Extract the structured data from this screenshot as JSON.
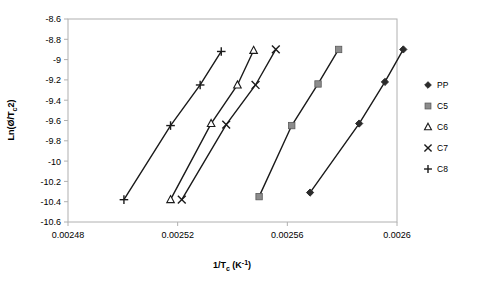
{
  "chart_data": {
    "type": "scatter",
    "title": "",
    "xlabel": "1/Tₑ (K⁻¹)",
    "xlabel_parts": {
      "pre": "1/T",
      "sub": "c",
      "post": " (K",
      "sup": "-1",
      "tail": ")"
    },
    "ylabel": "Ln(Ø/Tₑ 2)",
    "ylabel_parts": {
      "pre": "Ln(Ø/T",
      "sub": "c",
      "post": "2)"
    },
    "xlim": [
      0.00248,
      0.0026
    ],
    "ylim": [
      -10.6,
      -8.6
    ],
    "xticks": [
      "0.00248",
      "0.00252",
      "0.00256",
      "0.0026"
    ],
    "xtick_values": [
      0.00248,
      0.00252,
      0.00256,
      0.0026
    ],
    "yticks": [
      "-8.6",
      "-8.8",
      "-9",
      "-9.2",
      "-9.4",
      "-9.6",
      "-9.8",
      "-10",
      "-10.2",
      "-10.4",
      "-10.6"
    ],
    "ytick_values": [
      -8.6,
      -8.8,
      -9,
      -9.2,
      -9.4,
      -9.6,
      -9.8,
      -10,
      -10.2,
      -10.4,
      -10.6
    ],
    "grid": false,
    "legend_position": "right",
    "series": [
      {
        "name": "PP",
        "marker": "diamond",
        "color": "#2b2b2b",
        "x": [
          0.0025683,
          0.0025862,
          0.0025956,
          0.0026023
        ],
        "y": [
          -10.31,
          -9.63,
          -9.22,
          -8.9
        ]
      },
      {
        "name": "C5",
        "marker": "square",
        "color": "#8c8c8c",
        "x": [
          0.0025497,
          0.0025616,
          0.0025712,
          0.0025787
        ],
        "y": [
          -10.35,
          -9.65,
          -9.24,
          -8.9
        ]
      },
      {
        "name": "C6",
        "marker": "triangle",
        "color": "#1a1a1a",
        "x": [
          0.0025174,
          0.0025322,
          0.0025418,
          0.0025477
        ],
        "y": [
          -10.38,
          -9.63,
          -9.25,
          -8.91
        ]
      },
      {
        "name": "C7",
        "marker": "cross-x",
        "color": "#1a1a1a",
        "x": [
          0.0025215,
          0.0025377,
          0.0025484,
          0.0025558
        ],
        "y": [
          -10.38,
          -9.64,
          -9.25,
          -8.9
        ]
      },
      {
        "name": "C8",
        "marker": "plus",
        "color": "#1a1a1a",
        "x": [
          0.0025004,
          0.0025174,
          0.0025282,
          0.0025359
        ],
        "y": [
          -10.38,
          -9.65,
          -9.25,
          -8.92
        ]
      }
    ]
  },
  "legend": {
    "entries": [
      {
        "label": "PP",
        "marker": "diamond"
      },
      {
        "label": "C5",
        "marker": "square"
      },
      {
        "label": "C6",
        "marker": "triangle"
      },
      {
        "label": "C7",
        "marker": "cross-x"
      },
      {
        "label": "C8",
        "marker": "plus"
      }
    ]
  }
}
